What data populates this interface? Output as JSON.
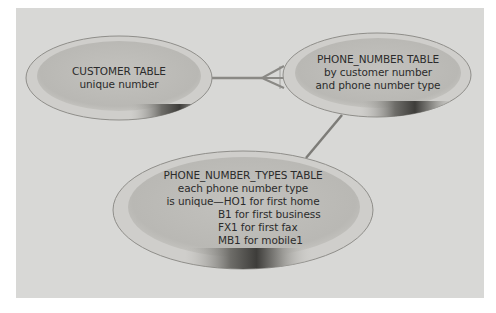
{
  "diagram": {
    "background_color": "#d8d8d6",
    "ellipse_fill": "#bdbcb8",
    "ellipse_rim": "#cfcecb",
    "ellipse_outline": "#8f8e8a",
    "connector_color": "#8a8985",
    "entities": [
      {
        "id": "customer",
        "title": "CUSTOMER TABLE",
        "lines": [
          "unique number"
        ]
      },
      {
        "id": "phone_number",
        "title": "PHONE_NUMBER TABLE",
        "lines": [
          "by customer number",
          "and phone number type"
        ]
      },
      {
        "id": "phone_number_types",
        "title": "PHONE_NUMBER_TYPES TABLE",
        "lines": [
          "each phone number type",
          "is unique—HO1 for first home",
          "B1 for first business",
          "FX1 for first fax",
          "MB1 for mobile1"
        ]
      }
    ],
    "relationships": [
      {
        "from": "customer",
        "to": "phone_number",
        "from_end": "one",
        "to_end": "many (crow's foot)"
      },
      {
        "from": "phone_number_types",
        "to": "phone_number",
        "from_end": "one",
        "to_end": "one"
      }
    ]
  }
}
